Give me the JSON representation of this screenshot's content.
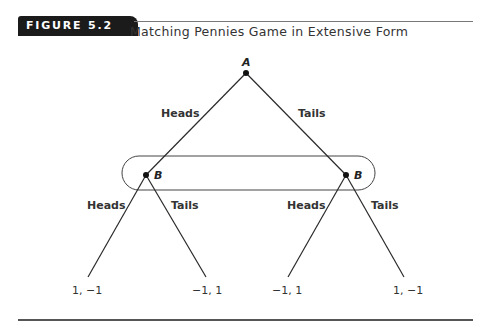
{
  "figure": {
    "tag": "FIGURE 5.2",
    "title": "Matching Pennies Game in Extensive Form"
  },
  "tree": {
    "root": {
      "player": "A"
    },
    "root_branches": [
      {
        "label": "Heads"
      },
      {
        "label": "Tails"
      }
    ],
    "information_set": {
      "player": "B",
      "nodes": [
        {
          "player": "B",
          "branches": [
            {
              "label": "Heads"
            },
            {
              "label": "Tails"
            }
          ]
        },
        {
          "player": "B",
          "branches": [
            {
              "label": "Heads"
            },
            {
              "label": "Tails"
            }
          ]
        }
      ]
    },
    "payoffs": [
      "1, −1",
      "−1, 1",
      "−1, 1",
      "1, −1"
    ]
  },
  "colors": {
    "tag_bg": "#1b1b1b",
    "line": "#2a2a2a",
    "text": "#333333"
  }
}
